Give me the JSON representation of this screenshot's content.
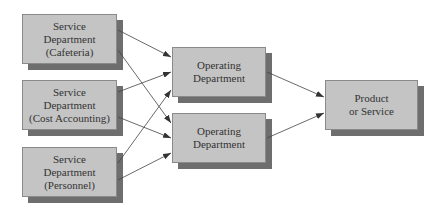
{
  "diagram": {
    "service_departments": [
      {
        "line1": "Service",
        "line2": "Department",
        "line3": "(Cafeteria)"
      },
      {
        "line1": "Service",
        "line2": "Department",
        "line3": "(Cost Accounting)"
      },
      {
        "line1": "Service",
        "line2": "Department",
        "line3": "(Personnel)"
      }
    ],
    "operating_departments": [
      {
        "line1": "Operating",
        "line2": "Department"
      },
      {
        "line1": "Operating",
        "line2": "Department"
      }
    ],
    "output": {
      "line1": "Product",
      "line2": "or Service"
    },
    "colors": {
      "box_fill": "#c4c4c4",
      "shadow": "#6e6e6e",
      "arrow": "#333333"
    }
  }
}
